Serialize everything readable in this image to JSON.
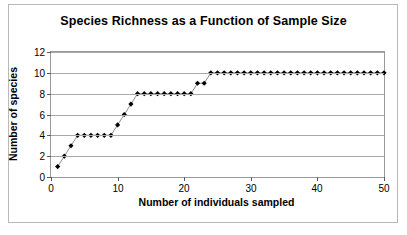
{
  "figure": {
    "title": "Species Richness as a Function of Sample Size",
    "background_color": "#ffffff",
    "frame_color": "#b9b9b9"
  },
  "chart_data": {
    "type": "scatter",
    "title": "Species Richness as a Function of Sample Size",
    "subtitle": "",
    "xlabel": "Number of individuals sampled",
    "ylabel": "Number of species",
    "xlim": [
      0,
      50
    ],
    "ylim": [
      0,
      12
    ],
    "xticks": [
      0,
      10,
      20,
      30,
      40,
      50
    ],
    "yticks": [
      0,
      2,
      4,
      6,
      8,
      10,
      12
    ],
    "grid": "horizontal",
    "legend": "none",
    "marker": "diamond",
    "marker_color": "#000000",
    "line_color": "#808080",
    "series": [
      {
        "name": "Species accumulation",
        "x": [
          1,
          2,
          3,
          4,
          5,
          6,
          7,
          8,
          9,
          10,
          11,
          12,
          13,
          14,
          15,
          16,
          17,
          18,
          19,
          20,
          21,
          22,
          23,
          24,
          25,
          26,
          27,
          28,
          29,
          30,
          31,
          32,
          33,
          34,
          35,
          36,
          37,
          38,
          39,
          40,
          41,
          42,
          43,
          44,
          45,
          46,
          47,
          48,
          49,
          50
        ],
        "values": [
          1,
          2,
          3,
          4,
          4,
          4,
          4,
          4,
          4,
          5,
          6,
          7,
          8,
          8,
          8,
          8,
          8,
          8,
          8,
          8,
          8,
          9,
          9,
          10,
          10,
          10,
          10,
          10,
          10,
          10,
          10,
          10,
          10,
          10,
          10,
          10,
          10,
          10,
          10,
          10,
          10,
          10,
          10,
          10,
          10,
          10,
          10,
          10,
          10,
          10
        ]
      }
    ]
  }
}
